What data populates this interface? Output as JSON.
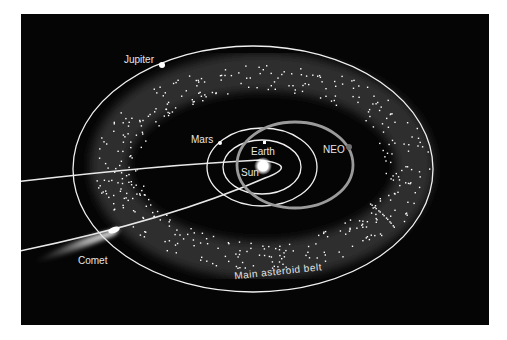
{
  "diagram": {
    "background": "#050505",
    "labels": {
      "jupiter": "Jupiter",
      "mars": "Mars",
      "earth": "Earth",
      "sun": "Sun",
      "neo": "NEO",
      "comet": "Comet",
      "belt": "Main asteroid belt"
    },
    "colors": {
      "orbit": "#f2f2f2",
      "neo_orbit": "#9a9a9a",
      "belt_glow": "#3a3a3a",
      "sun": "#ffffff",
      "neo_body": "#777777"
    }
  }
}
